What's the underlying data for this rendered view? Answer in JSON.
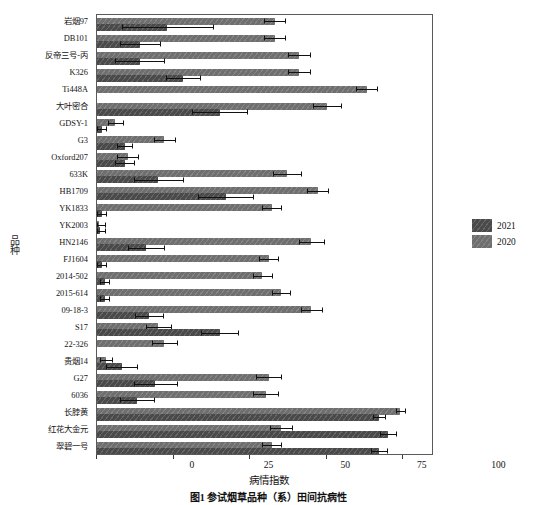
{
  "figure": {
    "caption": "图1  参试烟草品种（系）田间抗病性",
    "ylabel_chars": [
      "品",
      "种"
    ]
  },
  "legend": {
    "position": "right-middle",
    "entries": [
      {
        "label": "2021",
        "color": "#4a4a4a"
      },
      {
        "label": "2020",
        "color": "#6f6f6f"
      }
    ]
  },
  "chart_data": {
    "type": "bar",
    "orientation": "horizontal",
    "title": "图1  参试烟草品种（系）田间抗病性",
    "xlabel": "病情指数",
    "ylabel": "品种",
    "xlim": [
      0,
      110
    ],
    "xticks": [
      0,
      25,
      50,
      75,
      100
    ],
    "xticklabels": [
      "0",
      "25",
      "50",
      "75",
      "100"
    ],
    "grid": false,
    "categories": [
      "岩烟97",
      "DB101",
      "反帝三号-丙",
      "K326",
      "Ti448A",
      "大叶密合",
      "GDSY-1",
      "G3",
      "Oxford207",
      "633K",
      "HB1709",
      "YK1833",
      "YK2003",
      "HN2146",
      "FJ1604",
      "2014-502",
      "2015-614",
      "09-18-3",
      "S17",
      "22-326",
      "贵烟14",
      "G27",
      "6036",
      "长脖黄",
      "红花大金元",
      "翠碧一号"
    ],
    "series": [
      {
        "name": "2020",
        "color": "#6f6f6f",
        "values": [
          58,
          58,
          66,
          66,
          88,
          75,
          6,
          22,
          10,
          62,
          72,
          57,
          0.5,
          70,
          56,
          54,
          60,
          70,
          20,
          22,
          3,
          56,
          55,
          99,
          60,
          57
        ],
        "errors": [
          3.5,
          3.5,
          3.5,
          3.5,
          3.5,
          4.5,
          2.5,
          3.5,
          3.5,
          4.5,
          3.5,
          3,
          2,
          4,
          3,
          3,
          3,
          3.5,
          4,
          4,
          2,
          4,
          4,
          1.5,
          3.5,
          3
        ]
      },
      {
        "name": "2021",
        "color": "#4a4a4a",
        "values": [
          23,
          14,
          14,
          28,
          0,
          40,
          1.5,
          9,
          9,
          20,
          42,
          1.5,
          1,
          16,
          1.5,
          2.5,
          2.5,
          17,
          40,
          0,
          8,
          19,
          13,
          92,
          95,
          92
        ],
        "errors": [
          15,
          6.5,
          8,
          5.5,
          0,
          9,
          1.5,
          2.5,
          3,
          8,
          9,
          1.5,
          1.5,
          6,
          1.5,
          1.5,
          1.5,
          4.5,
          6,
          0,
          5,
          7,
          5.5,
          2,
          2.5,
          2.5
        ]
      }
    ]
  }
}
